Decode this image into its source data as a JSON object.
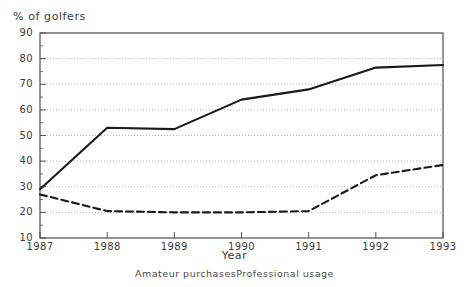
{
  "chart_data": {
    "type": "line",
    "title": "",
    "ylabel": "% of golfers",
    "xlabel": "Year",
    "x": [
      1987,
      1988,
      1989,
      1990,
      1991,
      1992,
      1993
    ],
    "xtick_labels": [
      "1987",
      "1988",
      "1989",
      "1990",
      "1991",
      "1992",
      "1993"
    ],
    "ytick_labels": [
      "10",
      "20",
      "30",
      "40",
      "50",
      "60",
      "70",
      "80",
      "90"
    ],
    "ylim": [
      10,
      90
    ],
    "ytick_step": 10,
    "grid": true,
    "grid_style": "dotted",
    "grid_color": "#b4b4b4",
    "legend_position": "bottom",
    "series": [
      {
        "name": "Amateur purchases",
        "style": "solid",
        "color": "#1a1a1a",
        "values": [
          29,
          53,
          52.5,
          64,
          68,
          76.5,
          77.5
        ]
      },
      {
        "name": "Professional usage",
        "style": "dashed",
        "color": "#1a1a1a",
        "values": [
          27,
          20.5,
          20,
          20,
          20.5,
          34.5,
          38.5
        ]
      }
    ]
  },
  "legend": {
    "item_1": "Amateur purchases",
    "item_2": "Professional usage"
  }
}
